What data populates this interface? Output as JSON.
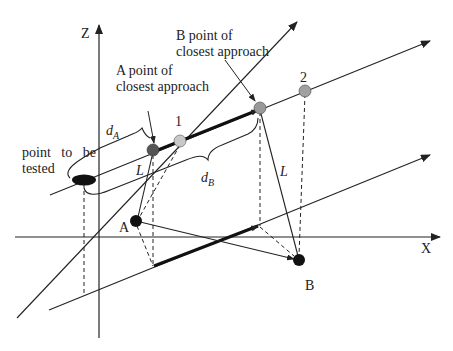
{
  "diagram": {
    "axes": {
      "z_label": "Z",
      "x_label": "X"
    },
    "labels": {
      "a_closest_line1": "A point of",
      "a_closest_line2": "closest approach",
      "b_closest_line1": "B point of",
      "b_closest_line2": "closest approach",
      "point_tested_line1": "point   to   be",
      "point_tested_line2": "tested",
      "point_1": "1",
      "point_2": "2",
      "point_a": "A",
      "point_b": "B",
      "d_a_main": "d",
      "d_a_sub": "A",
      "d_b_main": "d",
      "d_b_sub": "B",
      "l_left": "L",
      "l_right": "L"
    },
    "colors": {
      "line": "#222222",
      "point_dark": "#111111",
      "point_a_closest": "#555555",
      "point_1": "#c8c8c8",
      "point_b_closest": "#999999",
      "point_2": "#a0a0a0"
    }
  }
}
